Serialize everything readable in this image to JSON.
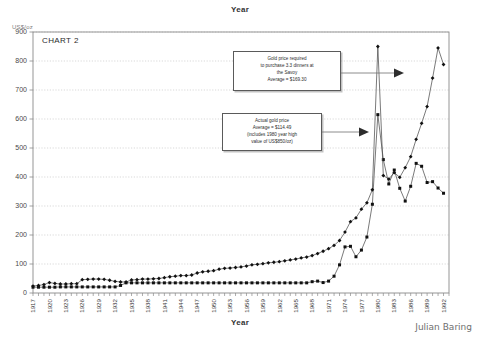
{
  "figure": {
    "top_axis_title": "Year",
    "bottom_axis_title": "Year",
    "y_axis_title": "US$/oz",
    "chart_label": "CHART 2",
    "signature": "Julian Baring"
  },
  "annotations": {
    "savoy": {
      "name": "gold-price-required-callout",
      "line1": "Gold price required",
      "line2": "to purchase 3.3 dinners at",
      "line3": "the Savoy",
      "line4": "Average = $169.30"
    },
    "actual": {
      "name": "actual-gold-price-callout",
      "line1": "Actual gold price",
      "line2": "Average = $114.49",
      "line3": "(includes 1980 year high",
      "line4": "value of US$850/oz)"
    }
  },
  "colors": {
    "series_line": "#4d4d4d",
    "marker": "#111111",
    "gridline": "#c8c8c8",
    "axis": "#888888",
    "box_border": "#5a5a5a",
    "arrow": "#4a4a4a"
  },
  "chart_data": {
    "type": "line",
    "title": "CHART 2",
    "xlabel": "Year",
    "ylabel": "US$/oz",
    "xlim": [
      1917,
      1993
    ],
    "ylim": [
      0,
      900
    ],
    "ytick_labels": [
      "0",
      "100",
      "200",
      "300",
      "400",
      "500",
      "600",
      "700",
      "800",
      "900"
    ],
    "ytick_values": [
      0,
      100,
      200,
      300,
      400,
      500,
      600,
      700,
      800,
      900
    ],
    "ytick_step": 100,
    "xtick_labels": [
      "1917",
      "1920",
      "1923",
      "1926",
      "1929",
      "1932",
      "1935",
      "1938",
      "1941",
      "1944",
      "1947",
      "1950",
      "1953",
      "1956",
      "1959",
      "1962",
      "1965",
      "1968",
      "1971",
      "1974",
      "1977",
      "1980",
      "1983",
      "1986",
      "1989",
      "1992"
    ],
    "xtick_step": 3,
    "grid": "horizontal-dotted",
    "legend": "none",
    "x": [
      1917,
      1918,
      1919,
      1920,
      1921,
      1922,
      1923,
      1924,
      1925,
      1926,
      1927,
      1928,
      1929,
      1930,
      1931,
      1932,
      1933,
      1934,
      1935,
      1936,
      1937,
      1938,
      1939,
      1940,
      1941,
      1942,
      1943,
      1944,
      1945,
      1946,
      1947,
      1948,
      1949,
      1950,
      1951,
      1952,
      1953,
      1954,
      1955,
      1956,
      1957,
      1958,
      1959,
      1960,
      1961,
      1962,
      1963,
      1964,
      1965,
      1966,
      1967,
      1968,
      1969,
      1970,
      1971,
      1972,
      1973,
      1974,
      1975,
      1976,
      1977,
      1978,
      1979,
      1980,
      1981,
      1982,
      1983,
      1984,
      1985,
      1986,
      1987,
      1988,
      1989,
      1990,
      1991,
      1992
    ],
    "series": [
      {
        "name": "Actual gold price",
        "marker": "square",
        "average": 114.49,
        "values": [
          20,
          20,
          20,
          20,
          20,
          21,
          21,
          21,
          21,
          21,
          21,
          21,
          21,
          21,
          21,
          21,
          26,
          35,
          35,
          35,
          35,
          35,
          35,
          35,
          35,
          35,
          35,
          35,
          35,
          35,
          35,
          35,
          35,
          35,
          35,
          35,
          35,
          35,
          35,
          35,
          35,
          35,
          35,
          35,
          35,
          35,
          35,
          35,
          35,
          35,
          35,
          39,
          41,
          36,
          41,
          58,
          97,
          159,
          161,
          125,
          148,
          193,
          306,
          615,
          460,
          376,
          424,
          361,
          317,
          368,
          447,
          437,
          381,
          384,
          362,
          344
        ]
      },
      {
        "name": "Gold price required to purchase 3.3 dinners at the Savoy",
        "marker": "diamond",
        "average": 169.3,
        "values": [
          24,
          26,
          29,
          36,
          33,
          31,
          31,
          32,
          32,
          46,
          47,
          48,
          48,
          47,
          44,
          40,
          38,
          38,
          45,
          46,
          48,
          48,
          49,
          50,
          53,
          56,
          58,
          60,
          60,
          62,
          69,
          73,
          75,
          77,
          82,
          85,
          86,
          88,
          90,
          93,
          97,
          99,
          101,
          104,
          106,
          108,
          111,
          114,
          117,
          121,
          124,
          129,
          136,
          144,
          153,
          164,
          181,
          210,
          246,
          259,
          289,
          311,
          356,
          850,
          405,
          393,
          415,
          399,
          432,
          470,
          530,
          585,
          643,
          741,
          845,
          788
        ]
      }
    ],
    "annotations": [
      {
        "text": "Gold price required to purchase 3.3 dinners at the Savoy  Average = $169.30",
        "points_to": "diamond-series"
      },
      {
        "text": "Actual gold price  Average = $114.49 (includes 1980 year high value of US$850/oz)",
        "points_to": "square-series"
      }
    ]
  }
}
